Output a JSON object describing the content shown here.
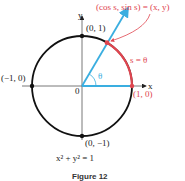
{
  "figure": {
    "caption": "Figure 12",
    "equation": "x² + y² = 1",
    "point_label": "(cos s, sin s) = (x, y)",
    "arc_label": "s = θ",
    "angle_label": "θ",
    "axis_x": "x",
    "axis_y": "y",
    "origin": "0",
    "points": {
      "top": "(0, 1)",
      "left": "(−1, 0)",
      "right": "(1, 0)",
      "bottom": "(0, −1)"
    },
    "colors": {
      "circle": "#111111",
      "ray": "#3aaee0",
      "arc": "#e0454f",
      "axes": "#555555"
    }
  }
}
